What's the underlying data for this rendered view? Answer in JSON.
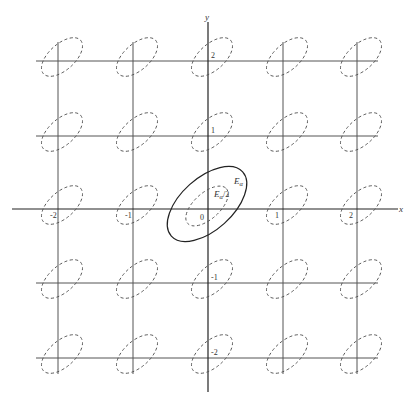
{
  "diagram": {
    "axes": {
      "x_label": "x",
      "y_label": "y"
    },
    "grid": {
      "x_ticks": [
        -2,
        -1,
        0,
        1,
        2
      ],
      "y_ticks": [
        2,
        1,
        0,
        -1,
        -2
      ],
      "x_positions": [
        58,
        133,
        208,
        283,
        357
      ],
      "y_positions": [
        61,
        136,
        209,
        283,
        358
      ]
    },
    "lattice_point_labels": {
      "x_axis": [
        "-2",
        "-1",
        "0",
        "1",
        "2"
      ],
      "y_axis": [
        "2",
        "1",
        "-1",
        "-2"
      ]
    },
    "center_sets": {
      "outer_label": "E",
      "outer_subscript": "α",
      "inner_label": "E",
      "inner_subscript": "α",
      "inner_suffix": "/2",
      "origin_label": "0"
    },
    "colors": {
      "line": "#555555",
      "axis": "#222222",
      "background": "#ffffff"
    }
  }
}
